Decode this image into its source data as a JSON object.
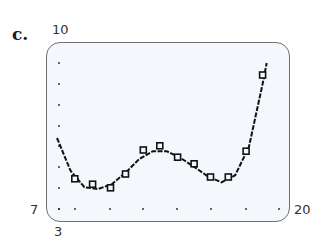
{
  "figure": {
    "part_label": "c.",
    "ymax_label": "10",
    "ymin_label": "7",
    "xmin_label": "3",
    "xmax_label": "20"
  },
  "colors": {
    "screen_background": "#f4f7fb",
    "screen_border": "#6e6e6e",
    "curve": "#111111",
    "points": "#111111"
  },
  "chart_data": {
    "type": "scatter",
    "title": "c.",
    "xlabel": "",
    "ylabel": "",
    "xlim": [
      3,
      20
    ],
    "ylim": [
      7,
      10
    ],
    "grid": "dot grid",
    "legend": null,
    "series": [
      {
        "name": "data points",
        "marker": "square",
        "x": [
          4.3,
          5.6,
          6.9,
          8.0,
          9.3,
          10.5,
          11.8,
          13.0,
          14.2,
          15.5,
          16.8,
          18.0
        ],
        "y": [
          7.72,
          7.63,
          7.57,
          7.8,
          8.2,
          8.27,
          8.08,
          7.97,
          7.75,
          7.75,
          8.18,
          9.45
        ]
      },
      {
        "name": "fitted polynomial curve",
        "type": "line",
        "x": [
          3.0,
          4.0,
          5.0,
          6.0,
          7.0,
          8.0,
          9.0,
          10.0,
          11.0,
          12.0,
          13.0,
          14.0,
          15.0,
          16.0,
          17.0,
          18.0,
          18.3
        ],
        "y": [
          8.4,
          7.85,
          7.58,
          7.55,
          7.63,
          7.82,
          8.05,
          8.18,
          8.18,
          8.07,
          7.92,
          7.76,
          7.66,
          7.78,
          8.25,
          9.3,
          9.65
        ]
      }
    ]
  }
}
